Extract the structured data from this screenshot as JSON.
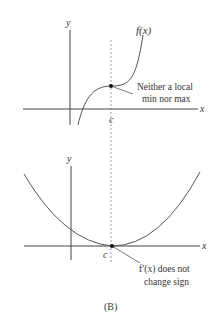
{
  "figure": {
    "caption": "(B)",
    "top_graph": {
      "y_axis_label": "y",
      "x_axis_label": "x",
      "c_label": "c",
      "curve_label": "f(x)",
      "annotation_line1": "Neither a local",
      "annotation_line2": "min nor max",
      "curve_type": "cubic inflection (horizontal tangent at c)"
    },
    "bottom_graph": {
      "y_axis_label": "y",
      "x_axis_label": "x",
      "c_label": "c",
      "annotation_line1": "f′(x) does not",
      "annotation_line2": "change sign",
      "curve_type": "parabola with minimum touching x-axis at c"
    },
    "colors": {
      "axis": "#444444",
      "curve": "#555555",
      "dashed": "#888888",
      "text": "#333333"
    }
  }
}
